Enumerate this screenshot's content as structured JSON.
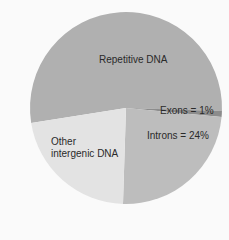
{
  "chart_data": {
    "type": "pie",
    "title": "",
    "slices": [
      {
        "label": "Repetitive DNA",
        "value": 53,
        "color": "#b0b0b0"
      },
      {
        "label": "Exons",
        "value": 1,
        "color": "#8c8c8c"
      },
      {
        "label": "Introns",
        "value": 24,
        "color": "#bdbdbd"
      },
      {
        "label": "Other intergenic DNA",
        "value": 22,
        "color": "#e3e3e3"
      }
    ],
    "annotations": {
      "repetitive": "Repetitive DNA",
      "exons": "Exons = 1%",
      "introns": "Introns = 24%",
      "other_line1": "Other",
      "other_line2": "intergenic DNA"
    },
    "legend": "none (labels inside slices)"
  }
}
